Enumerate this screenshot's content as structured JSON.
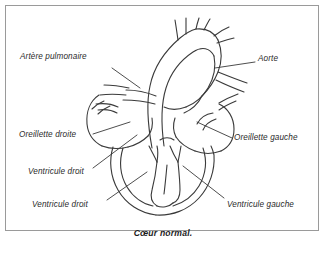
{
  "figure": {
    "caption": "Cœur normal.",
    "border_color": "#9a9a9a",
    "background_color": "#ffffff",
    "line_color": "#3a3a3a",
    "text_color": "#2b2b2b",
    "labels": [
      {
        "id": "pulmonary-artery",
        "text": "Artère pulmonaire"
      },
      {
        "id": "aorta",
        "text": "Aorte"
      },
      {
        "id": "right-atrium",
        "text": "Oreillette droite"
      },
      {
        "id": "left-atrium",
        "text": "Oreillette gauche"
      },
      {
        "id": "right-ventricle-upper",
        "text": "Ventricule droit"
      },
      {
        "id": "right-ventricle-lower",
        "text": "Ventricule droit"
      },
      {
        "id": "left-ventricle",
        "text": "Ventricule gauche"
      }
    ]
  }
}
